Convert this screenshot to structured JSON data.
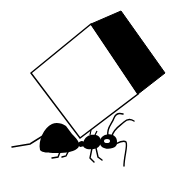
{
  "illustration": {
    "description": "Black-and-white line illustration of an ant lifting a large tilted cube on its back",
    "subjects": [
      "ant",
      "cube"
    ],
    "colors": {
      "background": "#ffffff",
      "ink": "#000000",
      "cube_front_face": "#ffffff",
      "cube_side_face": "#000000"
    },
    "cube": {
      "front_face_points": [
        [
          31,
          73
        ],
        [
          91,
          24
        ],
        [
          138,
          94
        ],
        [
          80,
          138
        ]
      ],
      "side_face_points": [
        [
          91,
          24
        ],
        [
          121,
          11
        ],
        [
          165,
          73
        ],
        [
          138,
          94
        ]
      ]
    }
  }
}
